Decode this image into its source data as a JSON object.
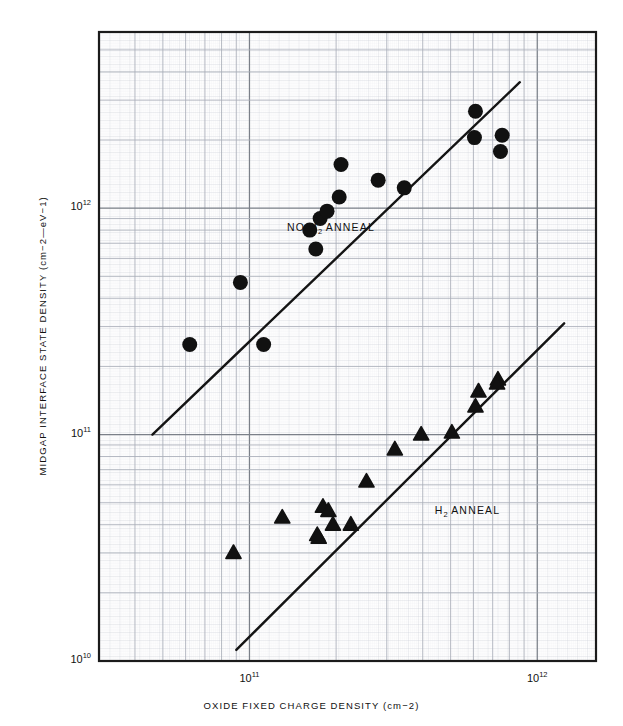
{
  "chart_data": {
    "type": "scatter",
    "title": "",
    "xlabel": "OXIDE FIXED CHARGE DENSITY (cm−2)",
    "ylabel": "MIDGAP INTERFACE STATE DENSITY (cm−2—eV−1)",
    "xscale": "log",
    "yscale": "log",
    "xlim": [
      30000000000.0,
      1600000000000.0
    ],
    "ylim": [
      10000000000.0,
      6000000000000.0
    ],
    "grid": true,
    "grid_style": "fine log graph paper, minor + major rules",
    "legend": "none (inline annotations)",
    "x_ticks": [
      {
        "value": 100000000000.0,
        "label_mantissa": "10",
        "label_exponent": "11"
      },
      {
        "value": 1000000000000.0,
        "label_mantissa": "10",
        "label_exponent": "12"
      }
    ],
    "y_ticks": [
      {
        "value": 10000000000.0,
        "label_mantissa": "10",
        "label_exponent": "10"
      },
      {
        "value": 100000000000.0,
        "label_mantissa": "10",
        "label_exponent": "11"
      },
      {
        "value": 1000000000000.0,
        "label_mantissa": "10",
        "label_exponent": "12"
      }
    ],
    "annotations": [
      {
        "text_prefix": "NO H",
        "text_sub": "2",
        "text_suffix": " ANNEAL",
        "x": 135000000000.0,
        "y": 820000000000.0
      },
      {
        "text_prefix": "H",
        "text_sub": "2",
        "text_suffix": " ANNEAL",
        "x": 440000000000.0,
        "y": 46000000000.0
      }
    ],
    "series": [
      {
        "name": "NO H2 ANNEAL",
        "marker": "circle",
        "color": "#111111",
        "marker_size_px": 15,
        "points": [
          {
            "x": 62000000000.0,
            "y": 250000000000.0
          },
          {
            "x": 93000000000.0,
            "y": 470000000000.0
          },
          {
            "x": 112000000000.0,
            "y": 250000000000.0
          },
          {
            "x": 162000000000.0,
            "y": 800000000000.0
          },
          {
            "x": 170000000000.0,
            "y": 660000000000.0
          },
          {
            "x": 176000000000.0,
            "y": 900000000000.0
          },
          {
            "x": 186000000000.0,
            "y": 970000000000.0
          },
          {
            "x": 205000000000.0,
            "y": 1120000000000.0
          },
          {
            "x": 208000000000.0,
            "y": 1560000000000.0
          },
          {
            "x": 280000000000.0,
            "y": 1330000000000.0
          },
          {
            "x": 345000000000.0,
            "y": 1230000000000.0
          },
          {
            "x": 610000000000.0,
            "y": 2680000000000.0
          },
          {
            "x": 605000000000.0,
            "y": 2050000000000.0
          },
          {
            "x": 755000000000.0,
            "y": 2100000000000.0
          },
          {
            "x": 745000000000.0,
            "y": 1780000000000.0
          }
        ]
      },
      {
        "name": "H2 ANNEAL",
        "marker": "triangle",
        "color": "#111111",
        "marker_size_px": 14,
        "points": [
          {
            "x": 88000000000.0,
            "y": 30000000000.0
          },
          {
            "x": 130000000000.0,
            "y": 43000000000.0
          },
          {
            "x": 172000000000.0,
            "y": 36000000000.0
          },
          {
            "x": 174000000000.0,
            "y": 35000000000.0
          },
          {
            "x": 180000000000.0,
            "y": 48000000000.0
          },
          {
            "x": 188000000000.0,
            "y": 46000000000.0
          },
          {
            "x": 195000000000.0,
            "y": 40000000000.0
          },
          {
            "x": 225000000000.0,
            "y": 40000000000.0
          },
          {
            "x": 255000000000.0,
            "y": 62000000000.0
          },
          {
            "x": 320000000000.0,
            "y": 86000000000.0
          },
          {
            "x": 395000000000.0,
            "y": 100000000000.0
          },
          {
            "x": 505000000000.0,
            "y": 102000000000.0
          },
          {
            "x": 625000000000.0,
            "y": 155000000000.0
          },
          {
            "x": 730000000000.0,
            "y": 175000000000.0
          },
          {
            "x": 725000000000.0,
            "y": 168000000000.0
          },
          {
            "x": 610000000000.0,
            "y": 133000000000.0
          }
        ]
      }
    ],
    "trend_lines": [
      {
        "name": "no-h2-anneal-fit",
        "x1": 46000000000.0,
        "y1": 100000000000.0,
        "x2": 870000000000.0,
        "y2": 3600000000000.0
      },
      {
        "name": "h2-anneal-fit",
        "x1": 90000000000.0,
        "y1": 11200000000.0,
        "x2": 1240000000000.0,
        "y2": 310000000000.0
      }
    ]
  }
}
